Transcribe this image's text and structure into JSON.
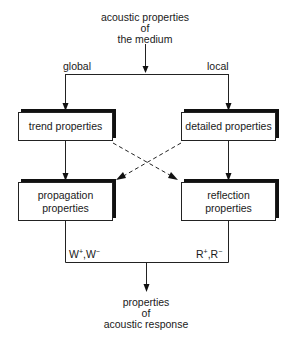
{
  "diagram": {
    "source": {
      "lines": [
        "acoustic properties",
        "of",
        "the medium"
      ]
    },
    "branches": {
      "left_label": "global",
      "right_label": "local"
    },
    "nodes": {
      "trend": {
        "label": "trend properties"
      },
      "detailed": {
        "label": "detailed properties"
      },
      "propagation": {
        "lines": [
          "propagation",
          "properties"
        ]
      },
      "reflection": {
        "lines": [
          "reflection",
          "properties"
        ]
      }
    },
    "outputs": {
      "left": {
        "base1": "W",
        "sup1": "+",
        "sep": ",",
        "base2": "W",
        "sup2": "−"
      },
      "right": {
        "base1": "R",
        "sup1": "+",
        "sep": ",",
        "base2": "R",
        "sup2": "−"
      }
    },
    "result": {
      "lines": [
        "properties",
        "of",
        "acoustic response"
      ]
    },
    "edges": [
      {
        "from": "source",
        "to": "trend",
        "style": "solid",
        "label": "global"
      },
      {
        "from": "source",
        "to": "detailed",
        "style": "solid",
        "label": "local"
      },
      {
        "from": "trend",
        "to": "propagation",
        "style": "solid"
      },
      {
        "from": "detailed",
        "to": "reflection",
        "style": "solid"
      },
      {
        "from": "trend",
        "to": "reflection",
        "style": "dashed"
      },
      {
        "from": "detailed",
        "to": "propagation",
        "style": "dashed"
      },
      {
        "from": "propagation",
        "to": "result",
        "style": "solid",
        "label": "W+,W−"
      },
      {
        "from": "reflection",
        "to": "result",
        "style": "solid",
        "label": "R+,R−"
      }
    ]
  }
}
